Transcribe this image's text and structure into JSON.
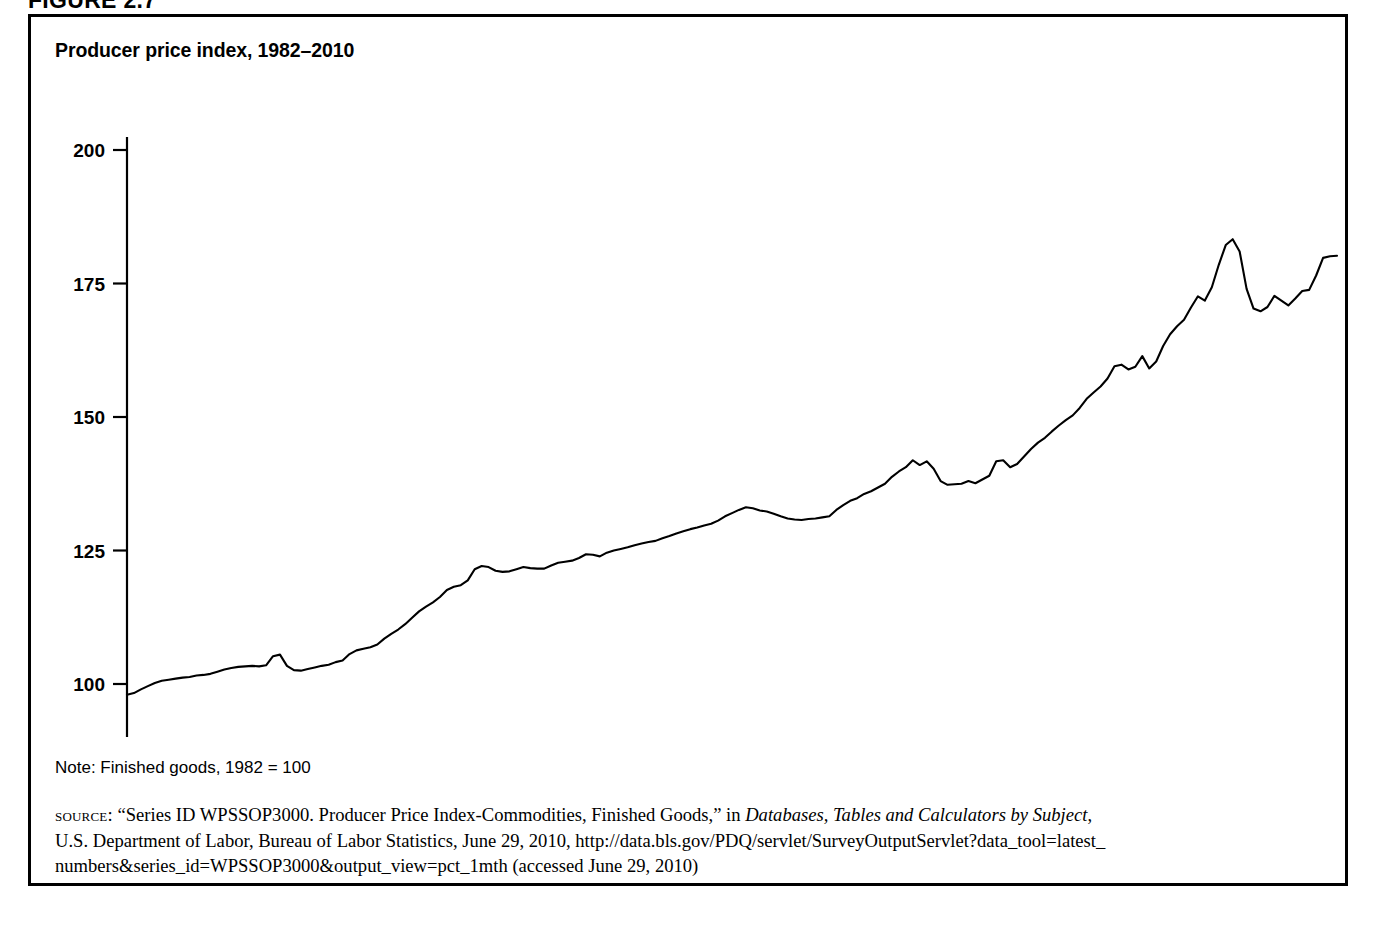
{
  "figure": {
    "label": "FIGURE 2.7"
  },
  "chart_title": "Producer price index, 1982–2010",
  "note": "Note: Finished goods, 1982 = 100",
  "source": {
    "kicker": "source:",
    "line1_pre": " “Series ID WPSSOP3000. Producer Price Index-Commodities, Finished Goods,” in ",
    "line1_italic": "Databases, Tables and Calculators by Subject",
    "line1_post": ",",
    "line2": "U.S. Department of Labor, Bureau of Labor Statistics, June 29, 2010, http://data.bls.gov/PDQ/servlet/SurveyOutputServlet?data_tool=latest_",
    "line3": "numbers&series_id=WPSSOP3000&output_view=pct_1mth (accessed June 29, 2010)"
  },
  "colors": {
    "line": "#000000",
    "axis": "#000000",
    "background": "#ffffff",
    "border": "#000000"
  },
  "chart_data": {
    "type": "line",
    "title": "Producer price index, 1982–2010",
    "xlabel": "",
    "ylabel": "",
    "xlim": [
      1982.0,
      1982.0
    ],
    "ylim": [
      93,
      200
    ],
    "grid": false,
    "legend": null,
    "y_ticks": [
      100,
      125,
      150,
      175,
      200
    ],
    "x_ticks": [
      1982,
      1984,
      1986,
      1988,
      1990,
      1992,
      1994,
      1996,
      1998,
      2000,
      2002,
      2004,
      2006,
      2008,
      2010
    ],
    "x_tick_labels": [
      "1982",
      "1984",
      "1986",
      "1988",
      "1990",
      "1992",
      "1994",
      "1996",
      "1998",
      "2000",
      "2002",
      "2004",
      "2006",
      "2008",
      "2010"
    ],
    "y_tick_labels": [
      "100",
      "125",
      "150",
      "175",
      "200"
    ],
    "series": [
      {
        "name": "Producer price index, finished goods (1982 = 100)",
        "x_start": 1982.0,
        "x_step": 0.25,
        "values": [
          98.0,
          98.3,
          99.0,
          99.6,
          100.2,
          100.6,
          100.8,
          101.0,
          101.2,
          101.3,
          101.6,
          101.7,
          101.9,
          102.3,
          102.7,
          103.0,
          103.2,
          103.3,
          103.4,
          103.3,
          103.5,
          105.2,
          105.5,
          103.4,
          102.6,
          102.5,
          102.8,
          103.1,
          103.4,
          103.6,
          104.1,
          104.4,
          105.6,
          106.3,
          106.6,
          106.9,
          107.4,
          108.5,
          109.4,
          110.2,
          111.2,
          112.4,
          113.6,
          114.5,
          115.3,
          116.3,
          117.6,
          118.2,
          118.5,
          119.4,
          121.5,
          122.1,
          121.9,
          121.2,
          121.0,
          121.1,
          121.5,
          121.9,
          121.7,
          121.6,
          121.6,
          122.2,
          122.7,
          122.9,
          123.1,
          123.6,
          124.3,
          124.2,
          123.9,
          124.6,
          125.0,
          125.3,
          125.6,
          126.0,
          126.3,
          126.6,
          126.8,
          127.3,
          127.7,
          128.2,
          128.6,
          129.0,
          129.3,
          129.7,
          130.0,
          130.6,
          131.4,
          132.0,
          132.6,
          133.1,
          132.9,
          132.5,
          132.3,
          131.9,
          131.4,
          131.0,
          130.8,
          130.7,
          130.9,
          131.0,
          131.2,
          131.4,
          132.6,
          133.5,
          134.3,
          134.8,
          135.6,
          136.1,
          136.8,
          137.5,
          138.8,
          139.8,
          140.6,
          141.9,
          141.0,
          141.7,
          140.3,
          138.0,
          137.3,
          137.4,
          137.5,
          138.0,
          137.6,
          138.3,
          139.0,
          141.7,
          141.9,
          140.6,
          141.2,
          142.6,
          144.0,
          145.2,
          146.1,
          147.3,
          148.4,
          149.4,
          150.3,
          151.7,
          153.4,
          154.6,
          155.7,
          157.2,
          159.5,
          159.8,
          158.9,
          159.4,
          161.4,
          159.1,
          160.4,
          163.3,
          165.5,
          167.0,
          168.2,
          170.5,
          172.6,
          171.8,
          174.3,
          178.5,
          182.2,
          183.3,
          181.0,
          174.0,
          170.3,
          169.8,
          170.6,
          172.7,
          171.8,
          170.9,
          172.2,
          173.6,
          173.8,
          176.5,
          179.8,
          180.1,
          180.2
        ]
      }
    ]
  }
}
